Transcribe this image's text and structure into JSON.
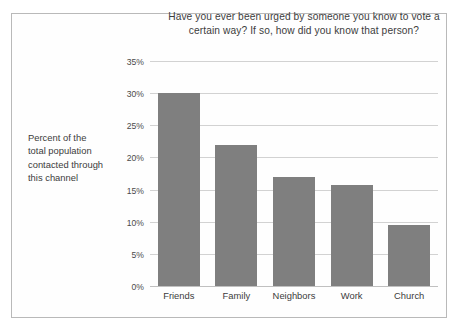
{
  "chart_data": {
    "type": "bar",
    "title": "Have you ever been urged by someone you know to vote a certain way? If so, how did you know that person?",
    "title_lines": [
      "Have you ever been urged by someone you know to vote a",
      "certain way? If so, how did you know that person?"
    ],
    "categories": [
      "Friends",
      "Family",
      "Neighbors",
      "Work",
      "Church"
    ],
    "values": [
      30.0,
      22.0,
      17.0,
      15.7,
      9.5
    ],
    "value_labels": [
      "30%",
      "22%",
      "17%",
      "15.7%",
      "9.5%"
    ],
    "xlabel": "",
    "ylabel": "Percent of the total population contacted through this channel",
    "ylabel_lines": [
      "Percent of the",
      "total population",
      "contacted through",
      "this channel"
    ],
    "ylim": [
      0,
      35
    ],
    "ytick_values": [
      0,
      5,
      10,
      15,
      20,
      25,
      30,
      35
    ],
    "ytick_labels": [
      "0%",
      "5%",
      "10%",
      "15%",
      "20%",
      "25%",
      "30%",
      "35%"
    ],
    "grid": true,
    "legend": "none",
    "bar_color": "#7f7f7f",
    "grid_color": "#d2d2d2",
    "frame_color": "#b9b9b9",
    "text_color": "#3c3c3c",
    "background": "#ffffff"
  }
}
